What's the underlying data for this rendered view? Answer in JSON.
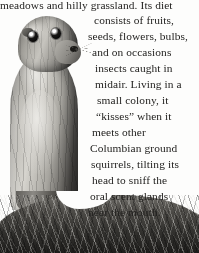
{
  "page": {
    "background_color": "#fdfdfc",
    "text_color": "#232220",
    "width": 199,
    "height": 253
  },
  "photo": {
    "subject": "columbian-ground-squirrel",
    "description": "Black and white photograph of a Columbian ground squirrel standing upright in grass",
    "style": "grayscale",
    "alt_text": "Columbian ground squirrel standing upright"
  },
  "body_text": {
    "full_text": "meadows and hilly grassland. Its diet consists of fruits, seeds, flowers, bulbs, and on occasions insects caught in midair. Living in a small colony, it “kisses” when it meets other Columbian ground squirrels, tilting its head to sniff the oral scent glands near the mouth.",
    "lines": [
      {
        "text": "meadows and hilly grassland. Its diet",
        "x": 0,
        "y": -1
      },
      {
        "text": "consists of fruits,",
        "x": 94,
        "y": 14
      },
      {
        "text": "seeds, flowers, bulbs,",
        "x": 88,
        "y": 30
      },
      {
        "text": "and on occasions",
        "x": 92,
        "y": 46
      },
      {
        "text": "insects caught in",
        "x": 95,
        "y": 62
      },
      {
        "text": "midair. Living in a",
        "x": 95,
        "y": 78
      },
      {
        "text": "small colony, it",
        "x": 97,
        "y": 94
      },
      {
        "text": "“kisses” when it",
        "x": 96,
        "y": 110
      },
      {
        "text": "meets other",
        "x": 92,
        "y": 126
      },
      {
        "text": "Columbian ground",
        "x": 90,
        "y": 142
      },
      {
        "text": "squirrels, tilting its",
        "x": 91,
        "y": 158
      },
      {
        "text": "head to sniff the",
        "x": 92,
        "y": 174
      },
      {
        "text": "oral scent glands",
        "x": 90,
        "y": 190
      },
      {
        "text": "near the mouth.",
        "x": 88,
        "y": 206
      }
    ]
  }
}
